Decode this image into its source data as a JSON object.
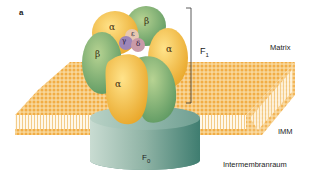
{
  "figure": {
    "panel_label": "a"
  },
  "labels": {
    "f1": "F",
    "f1_sub": "1",
    "f0": "F",
    "f0_sub": "0",
    "matrix": "Matrix",
    "imm": "IMM",
    "intermembrane": "Intermembranraum"
  },
  "subunits": {
    "alpha_top": "α",
    "beta_top": "β",
    "alpha_right": "α",
    "beta_left": "β",
    "alpha_front": "α",
    "gamma": "γ",
    "delta": "δ",
    "epsilon": "ε"
  },
  "colors": {
    "alpha": "#f2b632",
    "beta": "#8fb56a",
    "membrane": "#f6c36a",
    "f0": "#7fa59a",
    "gamma": "#9d86b8",
    "delta": "#c99aa8",
    "epsilon": "#e8c8b0"
  }
}
